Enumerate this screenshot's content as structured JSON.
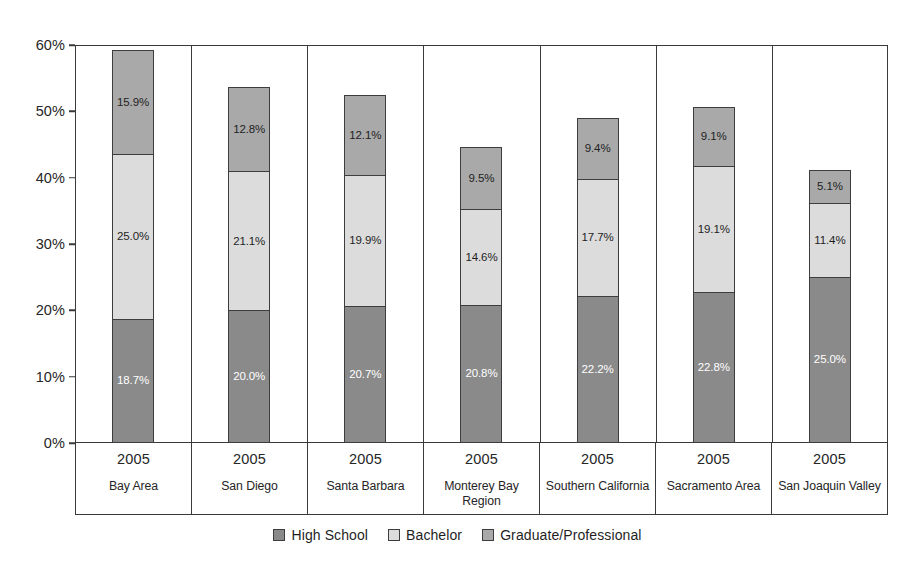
{
  "chart_data": {
    "type": "bar",
    "stacked": true,
    "title": "",
    "subtitle": "",
    "xlabel": "",
    "ylabel": "",
    "ylim": [
      0,
      60
    ],
    "y_ticks": [
      "0%",
      "10%",
      "20%",
      "30%",
      "40%",
      "50%",
      "60%"
    ],
    "y_tick_values": [
      0,
      10,
      20,
      30,
      40,
      50,
      60
    ],
    "grid": false,
    "legend_position": "bottom-center",
    "value_label_suffix": "%",
    "categories": [
      "Bay Area",
      "San Diego",
      "Santa Barbara",
      "Monterey Bay Region",
      "Southern California",
      "Sacramento Area",
      "San Joaquin Valley"
    ],
    "category_years": [
      "2005",
      "2005",
      "2005",
      "2005",
      "2005",
      "2005",
      "2005"
    ],
    "series": [
      {
        "name": "High School",
        "color": "#8a8a8a",
        "values": [
          18.7,
          20.0,
          20.7,
          20.8,
          22.2,
          22.8,
          25.0
        ],
        "labels": [
          "18.7%",
          "20.0%",
          "20.7%",
          "20.8%",
          "22.2%",
          "22.8%",
          "25.0%"
        ]
      },
      {
        "name": "Bachelor",
        "color": "#dcdcdc",
        "values": [
          25.0,
          21.1,
          19.9,
          14.6,
          17.7,
          19.1,
          11.4
        ],
        "labels": [
          "25.0%",
          "21.1%",
          "19.9%",
          "14.6%",
          "17.7%",
          "19.1%",
          "11.4%"
        ]
      },
      {
        "name": "Graduate/Professional",
        "color": "#a9a9a9",
        "values": [
          15.9,
          12.8,
          12.1,
          9.5,
          9.4,
          9.1,
          5.1
        ],
        "labels": [
          "15.9%",
          "12.8%",
          "12.1%",
          "9.5%",
          "9.4%",
          "9.1%",
          "5.1%"
        ]
      }
    ],
    "totals": [
      59.6,
      53.9,
      52.7,
      44.9,
      49.3,
      51.0,
      41.5
    ]
  },
  "legend": {
    "items": [
      {
        "label": "High School",
        "swatch": "swatch-high-school"
      },
      {
        "label": "Bachelor",
        "swatch": "swatch-bachelor"
      },
      {
        "label": "Graduate/Professional",
        "swatch": "swatch-graduate-professional"
      }
    ]
  }
}
